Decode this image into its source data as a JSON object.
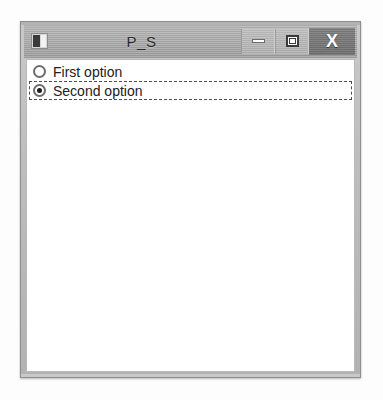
{
  "window": {
    "title": "P_S",
    "icon": "app-window-icon",
    "controls": {
      "minimize_label": "–",
      "minimize_name": "minimize-icon",
      "maximize_label": "□",
      "maximize_name": "maximize-icon",
      "close_label": "X",
      "close_name": "close-icon"
    }
  },
  "client": {
    "radio_group": {
      "name": "options",
      "options": [
        {
          "label": "First option",
          "selected": false,
          "focused": false
        },
        {
          "label": "Second option",
          "selected": true,
          "focused": true
        }
      ]
    }
  },
  "colors": {
    "titlebar": "#a8a8a8",
    "close_button": "#757575",
    "client_background": "#ffffff",
    "frame_border": "#8e8e8e",
    "text": "#212121",
    "focus_outline": "#4d4d4d"
  }
}
